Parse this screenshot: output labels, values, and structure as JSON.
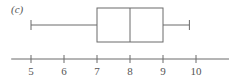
{
  "chart_data": {
    "type": "boxplot",
    "title": "",
    "panel_label": "(c)",
    "xlabel": "",
    "ylabel": "",
    "orientation": "horizontal",
    "axis": {
      "xlim": [
        4.4,
        11.0
      ],
      "ticks": [
        5,
        6,
        7,
        8,
        9,
        10
      ],
      "tick_labels": [
        "5",
        "6",
        "7",
        "8",
        "9",
        "10"
      ]
    },
    "grid": false,
    "legend": null,
    "box": {
      "min": 5,
      "q1": 7,
      "median": 8,
      "q3": 9,
      "max": 9.8
    }
  },
  "colors": {
    "line": "#6b6b6b",
    "text": "#555555",
    "background": "#ffffff"
  }
}
